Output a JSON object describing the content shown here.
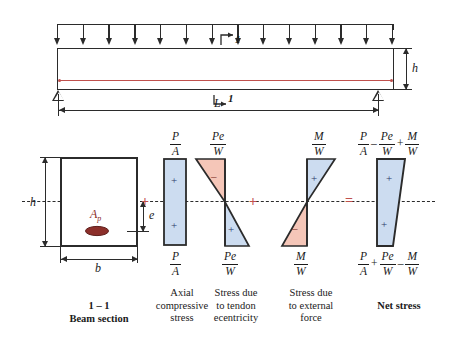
{
  "figure": {
    "colors": {
      "compression_fill": "#ccdcf0",
      "tension_fill": "#f5c6b8",
      "tendon": "#c0504d",
      "outline": "#2b2b2b",
      "operator": "#c0504d"
    }
  },
  "beam_diagram": {
    "section_marker": "1",
    "span_label": "L",
    "depth_label": "h",
    "load_arrow_count": 14
  },
  "cross_section": {
    "width_label": "b",
    "height_label": "h",
    "eccentricity_label": "e",
    "tendon_area_label": "A",
    "tendon_area_sub": "p"
  },
  "operators": {
    "plus1": "+",
    "plus2": "+",
    "equals": "="
  },
  "blocks": [
    {
      "id": "section",
      "caption_line1": "1 – 1",
      "caption_line2": "Beam section"
    },
    {
      "id": "axial",
      "top_num": "P",
      "top_den": "A",
      "bottom_num": "P",
      "bottom_den": "A",
      "sign_top": "+",
      "sign_bottom": "+",
      "caption_line1": "Axial",
      "caption_line2": "compressive",
      "caption_line3": "stress"
    },
    {
      "id": "tendon-eccentricity",
      "top_num": "Pe",
      "top_den": "W",
      "bottom_num": "Pe",
      "bottom_den": "W",
      "sign_top": "–",
      "sign_bottom": "+",
      "caption_line1": "Stress due",
      "caption_line2": "to tendon",
      "caption_line3": "ecentricity"
    },
    {
      "id": "external-force",
      "top_num": "M",
      "top_den": "W",
      "bottom_num": "M",
      "bottom_den": "W",
      "sign_top": "+",
      "sign_bottom": "–",
      "caption_line1": "Stress due",
      "caption_line2": "to external",
      "caption_line3": "force"
    },
    {
      "id": "net-stress",
      "top_formula": [
        {
          "num": "P",
          "den": "A"
        },
        {
          "op": "–"
        },
        {
          "num": "Pe",
          "den": "W"
        },
        {
          "op": "+"
        },
        {
          "num": "M",
          "den": "W"
        }
      ],
      "bottom_formula": [
        {
          "num": "P",
          "den": "A"
        },
        {
          "op": "+"
        },
        {
          "num": "Pe",
          "den": "W"
        },
        {
          "op": "–"
        },
        {
          "num": "M",
          "den": "W"
        }
      ],
      "sign_top": "+",
      "sign_bottom": "+",
      "caption_line1": "Net stress"
    }
  ]
}
